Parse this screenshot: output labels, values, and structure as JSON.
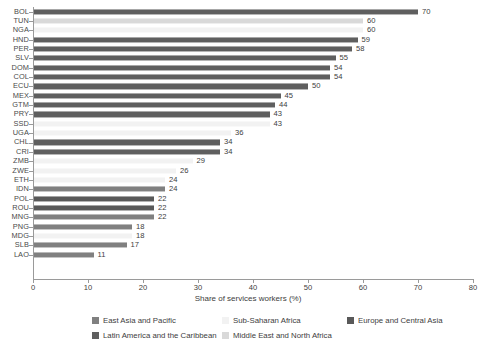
{
  "chart_data": {
    "type": "bar",
    "orientation": "horizontal",
    "title": "",
    "xlabel": "Share of services workers (%)",
    "ylabel": "",
    "xlim": [
      0,
      80
    ],
    "xticks": [
      0,
      10,
      20,
      30,
      40,
      50,
      60,
      70,
      80
    ],
    "grid": false,
    "legend_position": "bottom",
    "categories": [
      "BOL",
      "TUN",
      "NGA",
      "HND",
      "PER",
      "SLV",
      "DOM",
      "COL",
      "ECU",
      "MEX",
      "GTM",
      "PRY",
      "SSD",
      "UGA",
      "CHL",
      "CRI",
      "ZMB",
      "ZWE",
      "ETH",
      "IDN",
      "POL",
      "ROU",
      "MNG",
      "PNG",
      "MDG",
      "SLB",
      "LAO"
    ],
    "values": [
      70,
      60,
      60,
      59,
      58,
      55,
      54,
      54,
      50,
      45,
      44,
      43,
      43,
      36,
      34,
      34,
      29,
      26,
      24,
      24,
      22,
      22,
      22,
      18,
      18,
      17,
      11
    ],
    "groups": [
      "Latin America and the Caribbean",
      "Middle East and North Africa",
      "Sub-Saharan Africa",
      "Latin America and the Caribbean",
      "Latin America and the Caribbean",
      "Latin America and the Caribbean",
      "Latin America and the Caribbean",
      "Latin America and the Caribbean",
      "Latin America and the Caribbean",
      "Latin America and the Caribbean",
      "Latin America and the Caribbean",
      "Latin America and the Caribbean",
      "Sub-Saharan Africa",
      "Sub-Saharan Africa",
      "Latin America and the Caribbean",
      "Latin America and the Caribbean",
      "Sub-Saharan Africa",
      "Sub-Saharan Africa",
      "Sub-Saharan Africa",
      "East Asia and Pacific",
      "Europe and Central Asia",
      "Europe and Central Asia",
      "East Asia and Pacific",
      "East Asia and Pacific",
      "Sub-Saharan Africa",
      "East Asia and Pacific",
      "East Asia and Pacific"
    ],
    "legend": [
      {
        "label": "East Asia and Pacific",
        "color": "#808080"
      },
      {
        "label": "Sub-Saharan Africa",
        "color": "#f2f2f2"
      },
      {
        "label": "Europe and Central Asia",
        "color": "#595959"
      },
      {
        "label": "Latin America and the Caribbean",
        "color": "#5f5f5f"
      },
      {
        "label": "Middle East and North Africa",
        "color": "#d9d9d9"
      }
    ],
    "colors": {
      "East Asia and Pacific": "#808080",
      "Sub-Saharan Africa": "#f2f2f2",
      "Europe and Central Asia": "#595959",
      "Latin America and the Caribbean": "#5f5f5f",
      "Middle East and North Africa": "#d9d9d9"
    }
  }
}
